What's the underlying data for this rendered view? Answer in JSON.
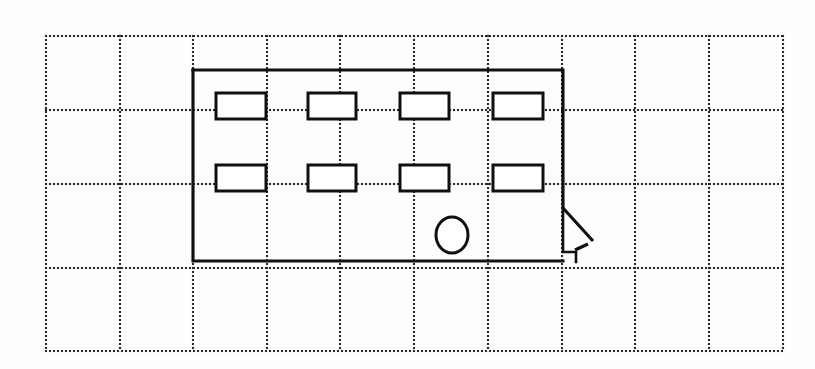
{
  "page": {
    "title": "Hand-drawn architectural floor plan sketch on dotted grid paper",
    "background_color": "#fdfdfd",
    "ink_color": "#101010",
    "grid_color": "#2b2b2b",
    "width": 815,
    "height": 369
  },
  "grid": {
    "style": "dotted",
    "dot_spacing": 4,
    "dot_size": 2.1,
    "x_lines": [
      46,
      120,
      193,
      267,
      340,
      414,
      488,
      562,
      635,
      709,
      783
    ],
    "y_lines": [
      36,
      110,
      184,
      268,
      351
    ],
    "x_start": 46,
    "x_end": 783,
    "y_start": 36,
    "y_end": 351,
    "column_spacing": 73.7,
    "row_spacing": 78.8
  },
  "plan": {
    "name": "building-outline",
    "description": "Rectangular room outline with stepped notch and door swing on the lower right",
    "outline_points": "193,70 563,70 563,208",
    "bottom_points": "193,70 193,261 563,261",
    "notch_points": "563,208 563,252 576,252 576,262",
    "door_swing_points": "563,208 593,241",
    "door_leaf_points": "575,250 588,244",
    "left_wall_x": 193,
    "right_wall_x": 563,
    "top_wall_y": 70,
    "bottom_wall_y": 261
  },
  "windows": {
    "label": "window-rectangles",
    "count": 8,
    "rows": [
      {
        "row_name": "upper-window-row",
        "y": 93,
        "height": 26,
        "items": [
          {
            "name": "window-1",
            "x": 216,
            "width": 50
          },
          {
            "name": "window-2",
            "x": 308,
            "width": 48
          },
          {
            "name": "window-3",
            "x": 400,
            "width": 49
          },
          {
            "name": "window-4",
            "x": 493,
            "width": 50
          }
        ]
      },
      {
        "row_name": "lower-window-row",
        "y": 165,
        "height": 26,
        "items": [
          {
            "name": "window-5",
            "x": 216,
            "width": 50
          },
          {
            "name": "window-6",
            "x": 308,
            "width": 48
          },
          {
            "name": "window-7",
            "x": 400,
            "width": 49
          },
          {
            "name": "window-8",
            "x": 493,
            "width": 50
          }
        ]
      }
    ]
  },
  "fixture": {
    "name": "circular-fixture",
    "shape": "ellipse",
    "cx": 452,
    "cy": 235,
    "rx": 16,
    "ry": 18
  }
}
